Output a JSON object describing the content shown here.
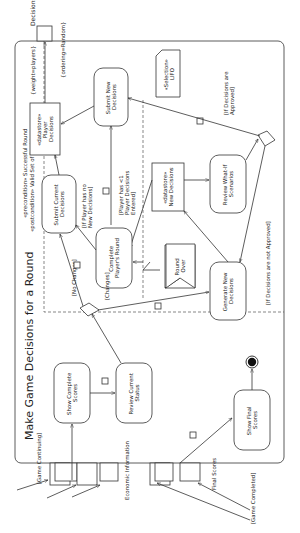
{
  "diagram": {
    "title": "Make Game Decisions for a Round",
    "precondition": "«precondition» Successful Round",
    "postcondition": "«postcondition» Valid Set of Decisions",
    "actions": {
      "show_complete_scores": [
        "Show Complete",
        "Scores"
      ],
      "review_current_status": [
        "Review Current",
        "Status"
      ],
      "submit_current_decisions": [
        "Submit Current",
        "Decisions"
      ],
      "complete_players_round": [
        "Complete",
        "Player's Round"
      ],
      "submit_new_decisions": [
        "Submit New",
        "Decisions"
      ],
      "generate_new_decisions": [
        "Generate New",
        "Decisions"
      ],
      "review_what_if": [
        "Review What-If",
        "Scenarios"
      ],
      "show_final_scores": [
        "Show Final",
        "Scores"
      ]
    },
    "datastores": {
      "player_decisions": [
        "«datastore»",
        "Player",
        "Decisions"
      ],
      "new_decisions": [
        "«datastore»",
        "New Decisions"
      ]
    },
    "note_selection": [
      "«Selection»",
      "LIFO"
    ],
    "signal_round_over": [
      "Round",
      "Over"
    ],
    "guards": {
      "no_changes": "[No Changes]",
      "changes": "[Changes]",
      "no_new_decisions": [
        "[If Player has no",
        "New Decisions]"
      ],
      "less_than_one": [
        "[Player has <1",
        "Player Decisions",
        "Entered]"
      ],
      "approved": [
        "[If Decisions are",
        "Approved]"
      ],
      "not_approved": "[If Decisions are not Approved]",
      "game_continuing": "[Game Continuing]",
      "game_completed": "[Game Completed]"
    },
    "pins": {
      "economic_information": "Economic Information",
      "final_scores": "Final Scores",
      "decisions": "Decisions"
    },
    "output_annotations": {
      "weight": "{weight=players}",
      "ordering": "{ordering=Random}"
    }
  }
}
